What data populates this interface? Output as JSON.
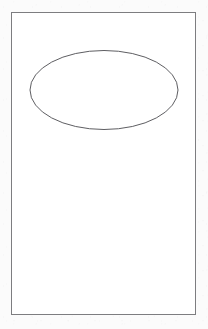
{
  "page": {
    "kind": "line-drawing",
    "width": 208,
    "height": 329,
    "background_color": "#fbfbfb",
    "caption": ""
  },
  "figure": {
    "title": "",
    "frame": {
      "label": "",
      "shape": "rectangle",
      "x": 11.5,
      "y": 12.5,
      "width": 184,
      "height": 302,
      "stroke_color": "#7d7d80",
      "stroke_width": 1,
      "fill_color": "#ffffff"
    },
    "shapes": [
      {
        "name": "ellipse",
        "label": "",
        "shape": "ellipse",
        "cx": 104,
        "cy": 90,
        "rx": 74,
        "ry": 39.5,
        "stroke_color": "#5e5e62",
        "stroke_width": 1,
        "fill_color": "none"
      }
    ]
  }
}
